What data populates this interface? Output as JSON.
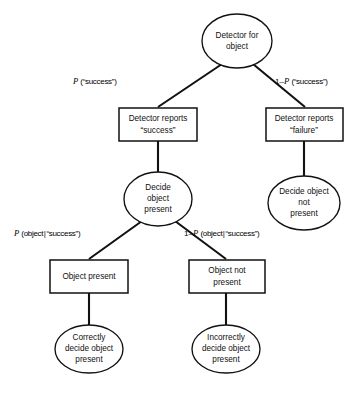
{
  "diagram": {
    "type": "probability-tree",
    "background_color": "#ffffff",
    "line_color": "#111111",
    "text_color": "#101010",
    "nodes": [
      {
        "id": "root",
        "shape": "ellipse",
        "lines": [
          "Detector for",
          "object"
        ],
        "cx": 237,
        "cy": 41,
        "rx": 35,
        "ry": 27
      },
      {
        "id": "reports-success",
        "shape": "rect",
        "lines": [
          "Detector reports",
          "“success”"
        ],
        "x": 119,
        "y": 108,
        "w": 78,
        "h": 33
      },
      {
        "id": "reports-failure",
        "shape": "rect",
        "lines": [
          "Detector reports",
          "“failure”"
        ],
        "x": 266,
        "y": 108,
        "w": 77,
        "h": 33
      },
      {
        "id": "decide-present",
        "shape": "ellipse",
        "lines": [
          "Decide",
          "object",
          "present"
        ],
        "cx": 158,
        "cy": 199,
        "rx": 34,
        "ry": 27
      },
      {
        "id": "decide-not-present",
        "shape": "ellipse",
        "lines": [
          "Decide object",
          "not",
          "present"
        ],
        "cx": 304,
        "cy": 203,
        "rx": 36,
        "ry": 27
      },
      {
        "id": "object-present",
        "shape": "rect",
        "lines": [
          "Object present"
        ],
        "x": 50,
        "y": 260,
        "w": 78,
        "h": 33
      },
      {
        "id": "object-not-present",
        "shape": "rect",
        "lines": [
          "Object not",
          "present"
        ],
        "x": 189,
        "y": 260,
        "w": 76,
        "h": 33
      },
      {
        "id": "correctly-decide",
        "shape": "ellipse",
        "lines": [
          "Correctly",
          "decide object",
          "present"
        ],
        "cx": 89,
        "cy": 349,
        "rx": 34,
        "ry": 24
      },
      {
        "id": "incorrectly-decide",
        "shape": "ellipse",
        "lines": [
          "Incorrectly",
          "decide object",
          "present"
        ],
        "cx": 226,
        "cy": 349,
        "rx": 34,
        "ry": 24
      }
    ],
    "edges": [
      {
        "id": "root-to-success",
        "from": "root",
        "to": "reports-success",
        "label": "P (“success”)"
      },
      {
        "id": "root-to-failure",
        "from": "root",
        "to": "reports-failure",
        "label": "1–P (“success”)"
      },
      {
        "id": "success-to-decide",
        "from": "reports-success",
        "to": "decide-present",
        "label": ""
      },
      {
        "id": "failure-to-decide-not",
        "from": "reports-failure",
        "to": "decide-not-present",
        "label": ""
      },
      {
        "id": "decide-to-object-present",
        "from": "decide-present",
        "to": "object-present",
        "label": "P (object|“success”)"
      },
      {
        "id": "decide-to-object-not-present",
        "from": "decide-present",
        "to": "object-not-present",
        "label": "1–P (object|“success”)"
      },
      {
        "id": "object-present-to-correct",
        "from": "object-present",
        "to": "correctly-decide",
        "label": ""
      },
      {
        "id": "object-not-present-to-incorrect",
        "from": "object-not-present",
        "to": "incorrectly-decide",
        "label": ""
      }
    ]
  },
  "labels": {
    "p_success_prefix": "",
    "p_success_var": "P",
    "p_success_rest": " (“success”)",
    "one_minus_p_success_prefix": "1–",
    "one_minus_p_success_var": "P",
    "one_minus_p_success_rest": " (“success”)",
    "p_object_prefix": "",
    "p_object_var": "P",
    "p_object_open": " (object",
    "p_object_bar": "|",
    "p_object_rest": "“success”)",
    "one_minus_p_object_prefix": "1–",
    "one_minus_p_object_var": "P",
    "one_minus_p_object_open": " (object",
    "one_minus_p_object_bar": "|",
    "one_minus_p_object_rest": "“success”)"
  },
  "node_text": {
    "root_l1": "Detector for",
    "root_l2": "object",
    "reports_success_l1": "Detector reports",
    "reports_success_l2": "“success”",
    "reports_failure_l1": "Detector reports",
    "reports_failure_l2": "“failure”",
    "decide_present_l1": "Decide",
    "decide_present_l2": "object",
    "decide_present_l3": "present",
    "decide_not_present_l1": "Decide object",
    "decide_not_present_l2": "not",
    "decide_not_present_l3": "present",
    "object_present_l1": "Object present",
    "object_not_present_l1": "Object not",
    "object_not_present_l2": "present",
    "correctly_l1": "Correctly",
    "correctly_l2": "decide object",
    "correctly_l3": "present",
    "incorrectly_l1": "Incorrectly",
    "incorrectly_l2": "decide object",
    "incorrectly_l3": "present"
  }
}
